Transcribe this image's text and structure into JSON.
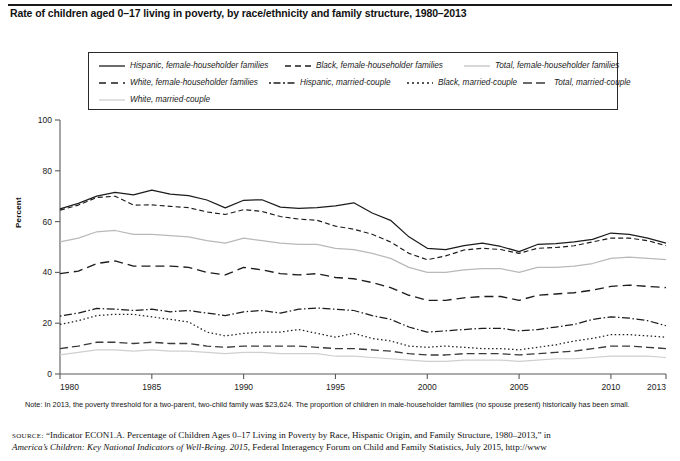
{
  "title": "Rate of children aged 0–17 living in poverty, by race/ethnicity and family structure, 1980–2013",
  "axes": {
    "ylabel": "Percent",
    "yticks": [
      "0",
      "20",
      "40",
      "60",
      "80",
      "100"
    ],
    "xticks": [
      "1980",
      "1985",
      "1990",
      "1995",
      "2000",
      "2005",
      "2010",
      "2013"
    ]
  },
  "legend": {
    "items": [
      {
        "label": "Hispanic, female-householder families",
        "style": "solid-dark"
      },
      {
        "label": "Black, female-householder families",
        "style": "dashed-dark"
      },
      {
        "label": "Total, female-householder families",
        "style": "solid-light"
      },
      {
        "label": "White, female-householder families",
        "style": "longdash-dark"
      },
      {
        "label": "Hispanic, married-couple",
        "style": "dashdot-dark"
      },
      {
        "label": "Black, married-couple",
        "style": "dotted-dark"
      },
      {
        "label": "Total, married-couple",
        "style": "longdash-mid"
      },
      {
        "label": "White, married-couple",
        "style": "solid-verylight"
      }
    ]
  },
  "notes": {
    "lead": "Note:",
    "text": " In 2013, the poverty threshold for a two-parent, two-child family was $23,624. The proportion of children in male-householder families (no spouse present) historically has been small."
  },
  "source": {
    "lead": "source:",
    "line1_q": "“Indicator ECON1.A. Percentage of Children Ages 0–17 Living in Poverty by Race, Hispanic Origin, and Family Structure, 1980–2013,” in",
    "line2_italic": "America’s Children: Key National Indicators of Well-Being. 2015",
    "line2_rest": ", Federal Interagency Forum on Child and Family Statistics, July 2015, http://www"
  },
  "colors": {
    "dark": "#1c1c1c",
    "mid": "#3a3a3a",
    "light": "#b9b9b9",
    "verylight": "#cfcfcf",
    "axis": "#5a5a5a",
    "border": "#2a2a2a"
  },
  "chart_data": {
    "type": "line",
    "title": "Rate of children aged 0–17 living in poverty, by race/ethnicity and family structure, 1980–2013",
    "xlabel": "",
    "ylabel": "Percent",
    "xlim": [
      1980,
      2013
    ],
    "ylim": [
      0,
      100
    ],
    "grid": false,
    "legend_position": "top",
    "x": [
      1980,
      1981,
      1982,
      1983,
      1984,
      1985,
      1986,
      1987,
      1988,
      1989,
      1990,
      1991,
      1992,
      1993,
      1994,
      1995,
      1996,
      1997,
      1998,
      1999,
      2000,
      2001,
      2002,
      2003,
      2004,
      2005,
      2006,
      2007,
      2008,
      2009,
      2010,
      2011,
      2012,
      2013
    ],
    "series": [
      {
        "name": "Hispanic, female-householder families",
        "style": "solid-dark",
        "values": [
          65.0,
          67.2,
          70.0,
          71.5,
          70.5,
          72.4,
          70.8,
          70.2,
          68.5,
          65.4,
          68.4,
          68.6,
          65.7,
          65.2,
          65.5,
          66.2,
          67.4,
          63.4,
          60.5,
          54.0,
          49.5,
          49.0,
          50.5,
          51.5,
          50.2,
          48.2,
          51.0,
          51.3,
          52.0,
          53.0,
          55.5,
          55.0,
          53.5,
          51.5
        ]
      },
      {
        "name": "Black, female-householder families",
        "style": "dashed-dark",
        "values": [
          64.5,
          66.5,
          69.5,
          70.0,
          66.5,
          66.6,
          66.0,
          65.5,
          63.8,
          62.8,
          64.7,
          64.0,
          62.0,
          61.0,
          60.5,
          58.2,
          57.0,
          55.0,
          52.0,
          47.5,
          45.0,
          46.5,
          48.8,
          49.5,
          49.0,
          47.5,
          49.5,
          49.8,
          50.5,
          52.0,
          53.5,
          53.5,
          52.5,
          50.5
        ]
      },
      {
        "name": "Total, female-householder families",
        "style": "solid-light",
        "values": [
          52.0,
          53.5,
          56.0,
          56.5,
          55.0,
          55.0,
          54.5,
          54.0,
          52.5,
          51.5,
          53.5,
          52.5,
          51.5,
          51.0,
          51.0,
          49.5,
          49.0,
          47.5,
          45.5,
          42.0,
          40.0,
          40.0,
          41.0,
          41.5,
          41.5,
          40.0,
          42.0,
          42.0,
          42.5,
          43.5,
          45.5,
          46.0,
          45.5,
          45.0
        ]
      },
      {
        "name": "White, female-householder families",
        "style": "longdash-dark",
        "values": [
          39.5,
          40.5,
          43.5,
          44.5,
          42.5,
          42.5,
          42.5,
          42.0,
          40.0,
          39.0,
          42.0,
          41.0,
          39.5,
          39.0,
          39.5,
          38.0,
          37.5,
          36.0,
          34.0,
          31.0,
          29.0,
          29.0,
          30.0,
          30.5,
          30.5,
          29.0,
          31.0,
          31.5,
          32.0,
          33.0,
          34.5,
          35.0,
          34.5,
          34.0
        ]
      },
      {
        "name": "Hispanic, married-couple",
        "style": "dashdot-dark",
        "values": [
          22.8,
          24.0,
          25.8,
          25.5,
          25.0,
          25.5,
          24.5,
          25.0,
          24.0,
          23.0,
          24.5,
          25.0,
          24.0,
          25.5,
          26.0,
          25.5,
          25.0,
          23.0,
          21.5,
          18.5,
          16.5,
          17.0,
          17.5,
          18.0,
          18.0,
          17.0,
          17.5,
          18.5,
          19.5,
          21.5,
          22.5,
          22.0,
          21.0,
          19.0
        ]
      },
      {
        "name": "Black, married-couple",
        "style": "dotted-dark",
        "values": [
          19.5,
          21.0,
          23.0,
          23.5,
          23.5,
          22.5,
          21.5,
          20.5,
          16.5,
          15.0,
          16.0,
          16.5,
          16.5,
          17.5,
          16.0,
          14.5,
          16.0,
          14.0,
          13.0,
          11.0,
          10.5,
          11.0,
          10.5,
          10.0,
          10.0,
          9.5,
          10.5,
          11.5,
          13.0,
          14.0,
          15.5,
          15.5,
          15.0,
          14.5
        ]
      },
      {
        "name": "Total, married-couple",
        "style": "longdash-mid",
        "values": [
          10.0,
          11.0,
          12.5,
          12.5,
          12.0,
          12.5,
          12.0,
          12.0,
          11.0,
          10.5,
          11.0,
          11.0,
          11.0,
          11.0,
          10.5,
          10.0,
          10.0,
          9.5,
          9.0,
          8.0,
          7.5,
          7.5,
          8.0,
          8.0,
          8.0,
          7.5,
          8.0,
          8.5,
          9.0,
          10.0,
          11.0,
          11.0,
          10.5,
          10.0
        ]
      },
      {
        "name": "White, married-couple",
        "style": "solid-verylight",
        "values": [
          7.5,
          8.5,
          9.5,
          9.5,
          9.0,
          9.5,
          9.0,
          9.0,
          8.5,
          8.0,
          8.5,
          8.5,
          8.0,
          8.0,
          8.0,
          7.0,
          7.0,
          6.5,
          6.0,
          5.5,
          5.0,
          5.0,
          5.5,
          5.5,
          5.5,
          5.0,
          5.5,
          6.0,
          6.0,
          6.5,
          7.0,
          7.0,
          7.0,
          6.5
        ]
      }
    ]
  }
}
